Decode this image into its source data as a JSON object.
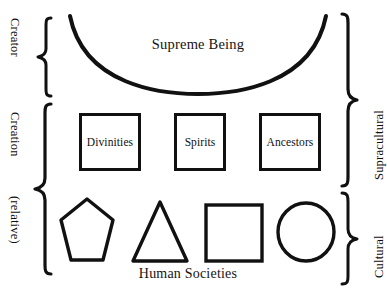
{
  "diagram": {
    "title_text": "Supreme Being",
    "left_labels": [
      {
        "id": "creator",
        "text": "Creator"
      },
      {
        "id": "creation",
        "text": "Creation"
      },
      {
        "id": "relative",
        "text": "(relative)"
      }
    ],
    "right_labels": [
      {
        "id": "supracultural",
        "text": "Supracultural"
      },
      {
        "id": "cultural",
        "text": "Cultural"
      }
    ],
    "tiers": {
      "supreme": {
        "label": "Supreme Being",
        "shape": "arc-open-upward"
      },
      "intermediaries": {
        "boxes": [
          {
            "label": "Divinities",
            "shape": "square"
          },
          {
            "label": "Spirits",
            "shape": "square"
          },
          {
            "label": "Ancestors",
            "shape": "square"
          }
        ]
      },
      "societies": {
        "label": "Human Societies",
        "shapes": [
          {
            "name": "pentagon"
          },
          {
            "name": "triangle"
          },
          {
            "name": "square"
          },
          {
            "name": "circle"
          }
        ]
      }
    },
    "colors": {
      "ink": "#111111",
      "background": "#ffffff"
    }
  }
}
